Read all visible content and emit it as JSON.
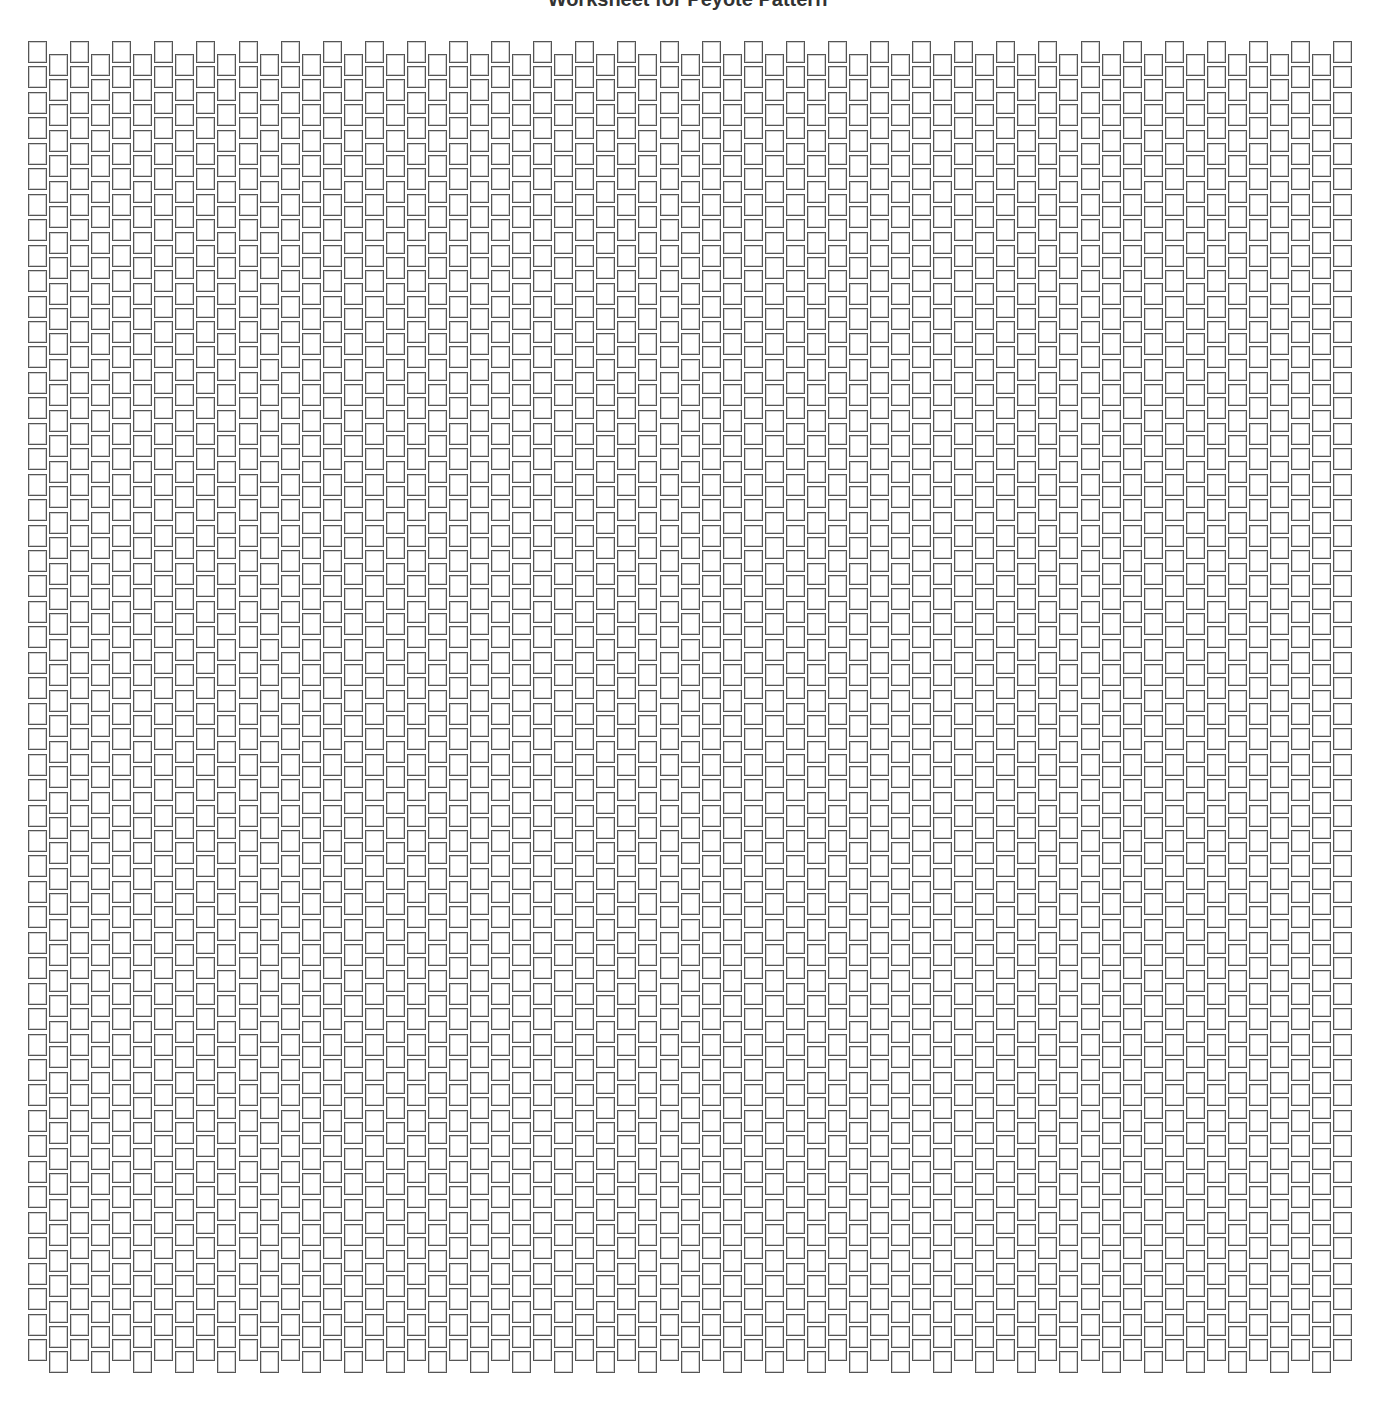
{
  "header": {
    "title": "Worksheet for Peyote Pattern"
  },
  "grid": {
    "columns": 63,
    "rows": 52,
    "origin_x": 28,
    "origin_y": 41,
    "col_pitch": 21.05,
    "row_pitch": 25.45,
    "odd_column_offset": 12.5,
    "bead_width": 19,
    "bead_height": 22,
    "bead_border_color": "#555555",
    "bead_fill": "#ffffff"
  }
}
